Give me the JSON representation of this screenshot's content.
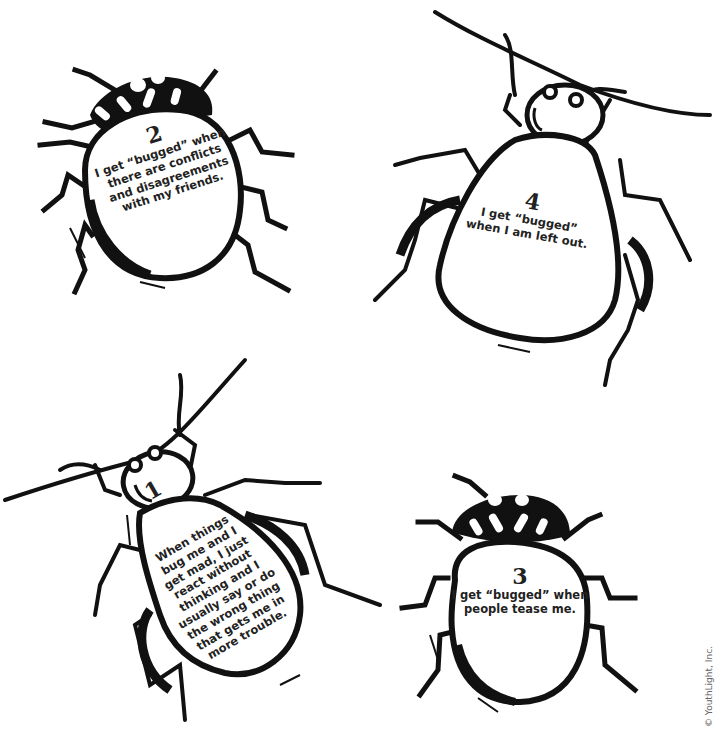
{
  "bugs": [
    {
      "id": 2,
      "number": "2",
      "lines": [
        "I get “bugged” when",
        "there are conflicts",
        "and disagreements",
        "with my friends."
      ]
    },
    {
      "id": 4,
      "number": "4",
      "lines": [
        "I get “bugged”",
        "when I am left out."
      ]
    },
    {
      "id": 1,
      "number": "1",
      "lines": [
        "When things",
        "bug me and I",
        "get mad, I just",
        "react without",
        "thinking and I",
        "usually say or do",
        "the wrong thing",
        "that gets me in",
        "more trouble."
      ]
    },
    {
      "id": 3,
      "number": "3",
      "lines": [
        "I get “bugged” when",
        "people tease me."
      ]
    }
  ],
  "copyright": "© YouthLight, Inc.",
  "colors": {
    "ink": "#111111",
    "paper": "#ffffff",
    "text": "#222222"
  }
}
